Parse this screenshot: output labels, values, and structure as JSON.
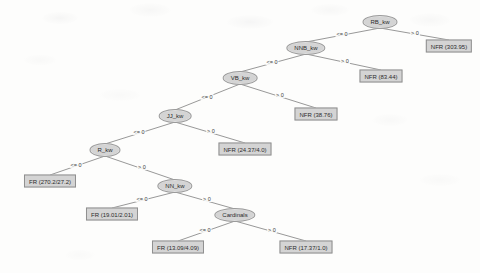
{
  "diagram": {
    "type": "decision-tree",
    "title": "",
    "colors": {
      "node_fill": "#d4d4d4",
      "node_border": "#9a9a9a",
      "edge_line": "#8c8c8c",
      "text": "#2b2b2b",
      "background": "#fdfdfc"
    },
    "edge_labels": {
      "left": "<= 0",
      "right": "> 0"
    },
    "nodes": [
      {
        "id": "n0",
        "kind": "internal",
        "label": "RB_kw",
        "x": 380,
        "y": 22
      },
      {
        "id": "n1",
        "kind": "internal",
        "label": "NNB_kw",
        "x": 306,
        "y": 48
      },
      {
        "id": "l0",
        "kind": "leaf",
        "label": "NFR (303.95)",
        "x": 449,
        "y": 46
      },
      {
        "id": "n2",
        "kind": "internal",
        "label": "VB_kw",
        "x": 240,
        "y": 78
      },
      {
        "id": "l1",
        "kind": "leaf",
        "label": "NFR (83.44)",
        "x": 381,
        "y": 76
      },
      {
        "id": "n3",
        "kind": "internal",
        "label": "JJ_kw",
        "x": 175,
        "y": 116
      },
      {
        "id": "l2",
        "kind": "leaf",
        "label": "NFR (38.76)",
        "x": 316,
        "y": 114
      },
      {
        "id": "n4",
        "kind": "internal",
        "label": "R_kw",
        "x": 105,
        "y": 150
      },
      {
        "id": "l3",
        "kind": "leaf",
        "label": "NFR (24.37/4.0)",
        "x": 245,
        "y": 149
      },
      {
        "id": "l4",
        "kind": "leaf",
        "label": "FR (270.2/27.2)",
        "x": 50,
        "y": 181
      },
      {
        "id": "n5",
        "kind": "internal",
        "label": "NN_kw",
        "x": 175,
        "y": 186
      },
      {
        "id": "l5",
        "kind": "leaf",
        "label": "FR (19.01/2.01)",
        "x": 112,
        "y": 214
      },
      {
        "id": "n6",
        "kind": "internal",
        "label": "Cardinals",
        "x": 235,
        "y": 215
      },
      {
        "id": "l6",
        "kind": "leaf",
        "label": "FR (13.09/4.09)",
        "x": 178,
        "y": 247
      },
      {
        "id": "l7",
        "kind": "leaf",
        "label": "NFR (17.37/1.0)",
        "x": 306,
        "y": 247
      }
    ],
    "edges": [
      {
        "from": "n0",
        "to": "n1",
        "label": "<= 0",
        "lx": 342,
        "ly": 34
      },
      {
        "from": "n0",
        "to": "l0",
        "label": "> 0",
        "lx": 415,
        "ly": 33
      },
      {
        "from": "n1",
        "to": "n2",
        "label": "<= 0",
        "lx": 272,
        "ly": 62
      },
      {
        "from": "n1",
        "to": "l1",
        "label": "> 0",
        "lx": 345,
        "ly": 61
      },
      {
        "from": "n2",
        "to": "n3",
        "label": "<= 0",
        "lx": 207,
        "ly": 97
      },
      {
        "from": "n2",
        "to": "l2",
        "label": "> 0",
        "lx": 280,
        "ly": 95
      },
      {
        "from": "n3",
        "to": "n4",
        "label": "<= 0",
        "lx": 139,
        "ly": 132
      },
      {
        "from": "n3",
        "to": "l3",
        "label": "> 0",
        "lx": 211,
        "ly": 131
      },
      {
        "from": "n4",
        "to": "l4",
        "label": "<= 0",
        "lx": 76,
        "ly": 165
      },
      {
        "from": "n4",
        "to": "n5",
        "label": "> 0",
        "lx": 142,
        "ly": 167
      },
      {
        "from": "n5",
        "to": "l5",
        "label": "<= 0",
        "lx": 142,
        "ly": 199
      },
      {
        "from": "n5",
        "to": "n6",
        "label": "> 0",
        "lx": 207,
        "ly": 199
      },
      {
        "from": "n6",
        "to": "l6",
        "label": "<= 0",
        "lx": 205,
        "ly": 230
      },
      {
        "from": "n6",
        "to": "l7",
        "label": "> 0",
        "lx": 272,
        "ly": 230
      }
    ]
  }
}
